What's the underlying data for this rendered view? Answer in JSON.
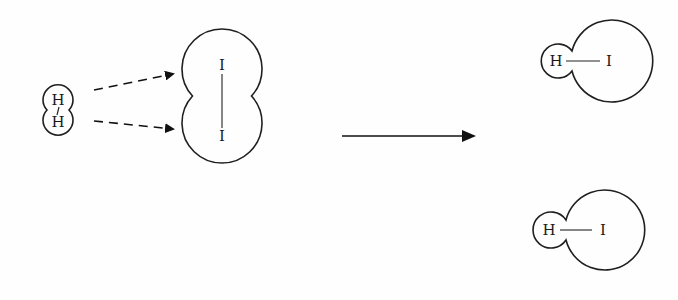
{
  "diagram": {
    "type": "reaction-mechanism",
    "reactants": {
      "h2": {
        "atoms": [
          "H",
          "H"
        ],
        "label_top": "H",
        "label_bottom": "H"
      },
      "i2": {
        "atoms": [
          "I",
          "I"
        ],
        "label_top": "I",
        "label_bottom": "I"
      }
    },
    "arrows": {
      "dashed": [
        {
          "from": "H (top)",
          "to": "I (top)",
          "style": "dashed"
        },
        {
          "from": "H (bottom)",
          "to": "I (bottom)",
          "style": "dashed"
        }
      ],
      "reaction": {
        "style": "solid",
        "direction": "right"
      }
    },
    "products": [
      {
        "h_label": "H",
        "i_label": "I"
      },
      {
        "h_label": "H",
        "i_label": "I"
      }
    ],
    "colors": {
      "line": "#1f1f1f",
      "background": "#ffffff"
    }
  }
}
